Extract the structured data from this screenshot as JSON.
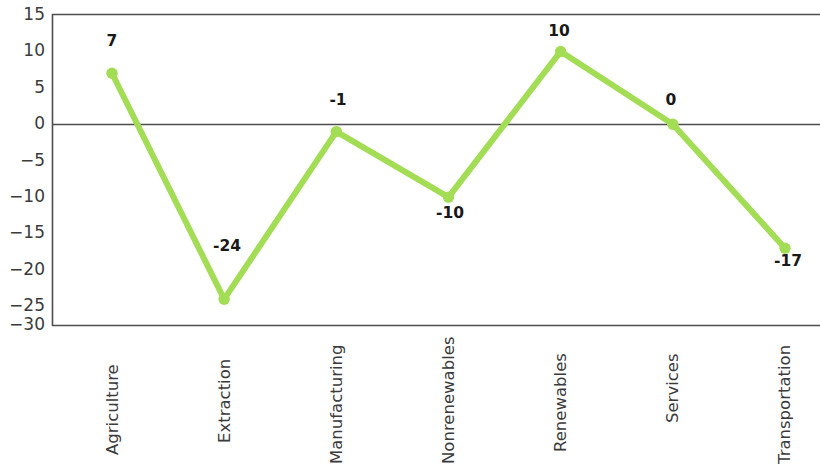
{
  "chart_data": {
    "type": "line",
    "title": "",
    "subtitle": "",
    "xlabel": "",
    "ylabel": "",
    "categories": [
      "Agriculture",
      "Extraction",
      "Manufacturing",
      "Nonrenewables",
      "Renewables",
      "Services",
      "Transportation"
    ],
    "values": [
      7,
      -24,
      -1,
      -10,
      10,
      0,
      -17
    ],
    "point_labels": [
      "7",
      "-24",
      "-1",
      "-10",
      "10",
      "0",
      "-17"
    ],
    "label_positions": [
      "above",
      "below",
      "above",
      "below",
      "above",
      "above",
      "below"
    ],
    "ylim": [
      -30,
      15
    ],
    "yticks": [
      15,
      10,
      5,
      0,
      -5,
      -10,
      -15,
      -20,
      -25,
      -30
    ],
    "ytick_labels": [
      "15",
      "10",
      "5",
      "0",
      "−5",
      "−10",
      "−15",
      "−20",
      "−25",
      "−30"
    ],
    "grid": false,
    "zero_line": true,
    "legend": null,
    "series": [
      {
        "name": "",
        "values": [
          7,
          -24,
          -1,
          -10,
          10,
          0,
          -17
        ]
      }
    ],
    "colors": {
      "line": "#a3dd55",
      "marker": "#a3dd55",
      "axis": "#4d4d4d",
      "text": "#3b3b3b",
      "label_text": "#191919",
      "background": "#ffffff"
    },
    "style": {
      "line_width": 6,
      "marker_size": 9,
      "xtick_label_rotation": -90
    }
  }
}
